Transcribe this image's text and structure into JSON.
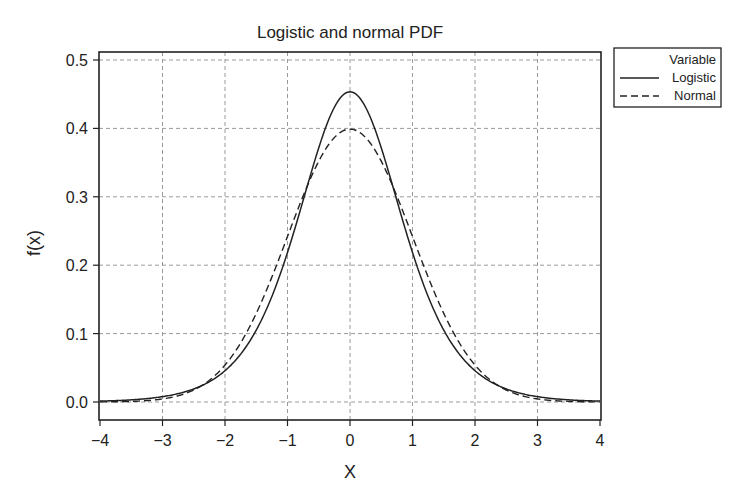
{
  "chart_data": {
    "type": "line",
    "title": "Logistic and  normal PDF",
    "xlabel": "X",
    "ylabel": "f(x)",
    "xlim": [
      -4,
      4
    ],
    "ylim": [
      -0.025,
      0.515
    ],
    "x_ticks": [
      "−4",
      "−3",
      "−2",
      "−1",
      "0",
      "1",
      "2",
      "3",
      "4"
    ],
    "y_ticks": [
      "0.0",
      "0.1",
      "0.2",
      "0.3",
      "0.4",
      "0.5"
    ],
    "grid": true,
    "legend": {
      "title": "Variable",
      "position": "outside-right-top",
      "entries": [
        {
          "label": "Logistic",
          "style": "solid"
        },
        {
          "label": "Normal",
          "style": "dashed"
        }
      ]
    },
    "x": [
      -4,
      -3.5,
      -3,
      -2.5,
      -2,
      -1.5,
      -1,
      -0.5,
      0,
      0.5,
      1,
      1.5,
      2,
      2.5,
      3,
      3.5,
      4
    ],
    "series": [
      {
        "name": "Logistic",
        "style": "solid",
        "description": "Logistic PDF scaled to unit variance (s = sqrt(3)/pi), peak ~0.453 at x=0",
        "values": [
          0.0024,
          0.0052,
          0.011,
          0.0226,
          0.0448,
          0.0843,
          0.1468,
          0.232,
          0.4534,
          0.232,
          0.1468,
          0.0843,
          0.0448,
          0.0226,
          0.011,
          0.0052,
          0.0024
        ]
      },
      {
        "name": "Normal",
        "style": "dashed",
        "description": "Standard normal PDF, peak ~0.399 at x=0",
        "values": [
          0.0001,
          0.0009,
          0.0044,
          0.0175,
          0.054,
          0.1295,
          0.242,
          0.3521,
          0.3989,
          0.3521,
          0.242,
          0.1295,
          0.054,
          0.0175,
          0.0044,
          0.0009,
          0.0001
        ]
      }
    ],
    "colors": {
      "line": "#222222",
      "grid": "#9a9a9a",
      "frame": "#222222"
    }
  }
}
